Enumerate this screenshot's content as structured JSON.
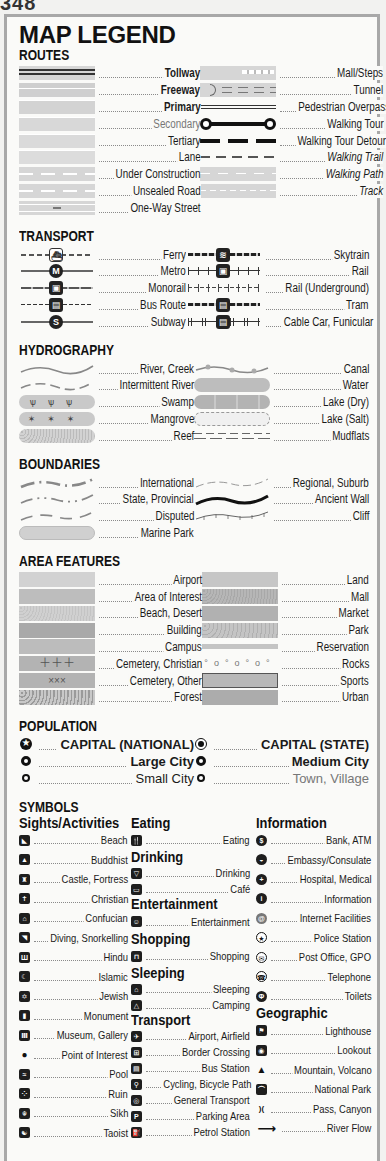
{
  "page_number": "348",
  "title": "MAP LEGEND",
  "routes": {
    "heading": "ROUTES",
    "left": [
      {
        "label": "Tollway",
        "style": "bold"
      },
      {
        "label": "Freeway",
        "style": "bold"
      },
      {
        "label": "Primary",
        "style": "bold"
      },
      {
        "label": "Secondary",
        "style": "normal"
      },
      {
        "label": "Tertiary",
        "style": "normal"
      },
      {
        "label": "Lane",
        "style": "normal"
      },
      {
        "label": "Under Construction",
        "style": "normal"
      },
      {
        "label": "Unsealed Road",
        "style": "normal"
      },
      {
        "label": "One-Way Street",
        "style": "normal"
      }
    ],
    "right": [
      {
        "label": "Mall/Steps",
        "style": "normal"
      },
      {
        "label": "Tunnel",
        "style": "normal"
      },
      {
        "label": "Pedestrian Overpass",
        "style": "normal"
      },
      {
        "label": "Walking Tour",
        "style": "normal"
      },
      {
        "label": "Walking Tour Detour",
        "style": "normal"
      },
      {
        "label": "Walking Trail",
        "style": "italic"
      },
      {
        "label": "Walking Path",
        "style": "italic"
      },
      {
        "label": "Track",
        "style": "italic"
      }
    ]
  },
  "transport": {
    "heading": "TRANSPORT",
    "left": [
      {
        "label": "Ferry",
        "icon": "ferry-icon",
        "glyph": "⛴"
      },
      {
        "label": "Metro",
        "icon": "metro-icon",
        "glyph": "M"
      },
      {
        "label": "Monorail",
        "icon": "monorail-icon",
        "glyph": "▣"
      },
      {
        "label": "Bus Route",
        "icon": "bus-icon",
        "glyph": "▤"
      },
      {
        "label": "Subway",
        "icon": "subway-icon",
        "glyph": "S"
      }
    ],
    "right": [
      {
        "label": "Skytrain",
        "icon": "skytrain-icon",
        "glyph": "≋"
      },
      {
        "label": "Rail",
        "icon": "rail-icon",
        "glyph": "▣"
      },
      {
        "label": "Rail (Underground)",
        "icon": "rail-underground-line",
        "glyph": ""
      },
      {
        "label": "Tram",
        "icon": "tram-icon",
        "glyph": "▤"
      },
      {
        "label": "Cable Car, Funicular",
        "icon": "cable-car-icon",
        "glyph": "▤"
      }
    ]
  },
  "hydrography": {
    "heading": "HYDROGRAPHY",
    "left": [
      "River, Creek",
      "Intermittent River",
      "Swamp",
      "Mangrove",
      "Reef"
    ],
    "right": [
      "Canal",
      "Water",
      "Lake (Dry)",
      "Lake (Salt)",
      "Mudflats"
    ]
  },
  "boundaries": {
    "heading": "BOUNDARIES",
    "left": [
      "International",
      "State, Provincial",
      "Disputed",
      "Marine Park"
    ],
    "right": [
      "Regional, Suburb",
      "Ancient Wall",
      "Cliff"
    ]
  },
  "area_features": {
    "heading": "AREA FEATURES",
    "left": [
      "Airport",
      "Area of Interest",
      "Beach, Desert",
      "Building",
      "Campus",
      "Cemetery, Christian",
      "Cemetery, Other",
      "Forest"
    ],
    "right": [
      "Land",
      "Mall",
      "Market",
      "Park",
      "Reservation",
      "Rocks",
      "Sports",
      "Urban"
    ]
  },
  "population": {
    "heading": "POPULATION",
    "left": [
      {
        "label": "CAPITAL (NATIONAL)",
        "icon": "capital-national-icon"
      },
      {
        "label": "Large City",
        "icon": "large-city-icon"
      },
      {
        "label": "Small City",
        "icon": "small-city-icon"
      }
    ],
    "right": [
      {
        "label": "CAPITAL (STATE)",
        "icon": "capital-state-icon"
      },
      {
        "label": "Medium City",
        "icon": "medium-city-icon"
      },
      {
        "label": "Town, Village",
        "icon": "town-icon"
      }
    ]
  },
  "symbols": {
    "heading": "SYMBOLS",
    "sights": {
      "heading": "Sights/Activities",
      "items": [
        {
          "label": "Beach",
          "glyph": "◣"
        },
        {
          "label": "Buddhist",
          "glyph": "▲"
        },
        {
          "label": "Castle, Fortress",
          "glyph": "♜"
        },
        {
          "label": "Christian",
          "glyph": "✝"
        },
        {
          "label": "Confucian",
          "glyph": "⌂"
        },
        {
          "label": "Diving, Snorkelling",
          "glyph": "◥"
        },
        {
          "label": "Hindu",
          "glyph": "Ш"
        },
        {
          "label": "Islamic",
          "glyph": "☾"
        },
        {
          "label": "Jewish",
          "glyph": "✡"
        },
        {
          "label": "Monument",
          "glyph": "▮"
        },
        {
          "label": "Museum, Gallery",
          "glyph": "Ⅲ"
        },
        {
          "label": "Point of Interest",
          "glyph": "●"
        },
        {
          "label": "Pool",
          "glyph": "≈"
        },
        {
          "label": "Ruin",
          "glyph": "⁘"
        },
        {
          "label": "Sikh",
          "glyph": "☬"
        },
        {
          "label": "Taoist",
          "glyph": "☯"
        }
      ]
    },
    "eating": {
      "heading": "Eating",
      "items": [
        {
          "label": "Eating",
          "glyph": "🍴"
        }
      ]
    },
    "drinking": {
      "heading": "Drinking",
      "items": [
        {
          "label": "Drinking",
          "glyph": "▽"
        },
        {
          "label": "Café",
          "glyph": "▭"
        }
      ]
    },
    "entertainment": {
      "heading": "Entertainment",
      "items": [
        {
          "label": "Entertainment",
          "glyph": "☺"
        }
      ]
    },
    "shopping": {
      "heading": "Shopping",
      "items": [
        {
          "label": "Shopping",
          "glyph": "⊓"
        }
      ]
    },
    "sleeping": {
      "heading": "Sleeping",
      "items": [
        {
          "label": "Sleeping",
          "glyph": "⌂"
        },
        {
          "label": "Camping",
          "glyph": "△"
        }
      ]
    },
    "transport": {
      "heading": "Transport",
      "items": [
        {
          "label": "Airport, Airfield",
          "glyph": "✈"
        },
        {
          "label": "Border Crossing",
          "glyph": "⊞"
        },
        {
          "label": "Bus Station",
          "glyph": "▤"
        },
        {
          "label": "Cycling, Bicycle Path",
          "glyph": "⚲"
        },
        {
          "label": "General Transport",
          "glyph": "◎"
        },
        {
          "label": "Parking Area",
          "glyph": "P"
        },
        {
          "label": "Petrol Station",
          "glyph": "⛽"
        }
      ]
    },
    "information": {
      "heading": "Information",
      "items": [
        {
          "label": "Bank, ATM",
          "glyph": "$"
        },
        {
          "label": "Embassy/Consulate",
          "glyph": "◒"
        },
        {
          "label": "Hospital, Medical",
          "glyph": "+"
        },
        {
          "label": "Information",
          "glyph": "i"
        },
        {
          "label": "Internet Facilities",
          "glyph": "@"
        },
        {
          "label": "Police Station",
          "glyph": "★"
        },
        {
          "label": "Post Office, GPO",
          "glyph": "✉"
        },
        {
          "label": "Telephone",
          "glyph": "☎"
        },
        {
          "label": "Toilets",
          "glyph": "Φ"
        }
      ]
    },
    "geographic": {
      "heading": "Geographic",
      "items": [
        {
          "label": "Lighthouse",
          "glyph": "⚑"
        },
        {
          "label": "Lookout",
          "glyph": "◉"
        },
        {
          "label": "Mountain, Volcano",
          "glyph": "▲"
        },
        {
          "label": "National Park",
          "glyph": "⌒"
        },
        {
          "label": "Pass, Canyon",
          "glyph": ")("
        },
        {
          "label": "River Flow",
          "glyph": "⟶"
        }
      ]
    }
  },
  "colors": {
    "swatch_grey": "#d6d6d6",
    "dark_grey": "#a9a9a9",
    "mid_grey": "#bdbdbd",
    "ink": "#1a1a1a",
    "frame": "#a8a8a8"
  }
}
